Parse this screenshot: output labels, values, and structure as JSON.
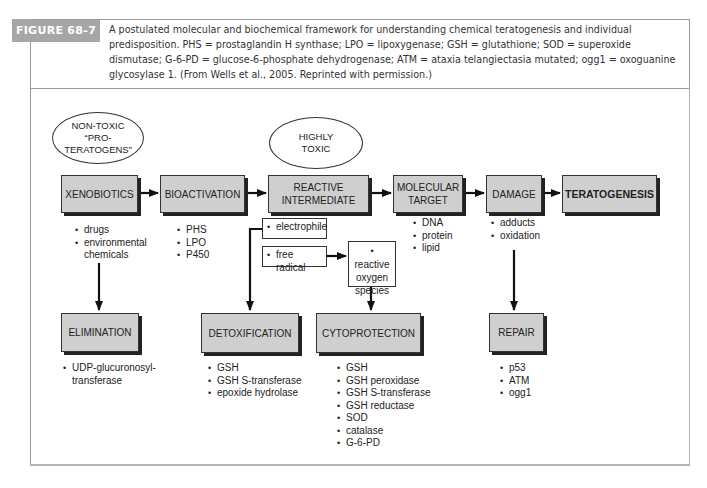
{
  "figure": {
    "label": "FIGURE 68-7",
    "caption": "A postulated molecular and biochemical framework for understanding chemical teratogenesis and individual predisposition. PHS = prostaglandin H synthase; LPO = lipoxygenase; GSH = glutathione; SOD = superoxide dismutase; G-6-PD = glucose-6-phosphate dehydrogenase; ATM = ataxia telangiectasia mutated; ogg1 = oxoguanine glycosylase 1. (From Wells et al., 2005. Reprinted with permission.)",
    "accent_color": "#a6a6a6"
  },
  "ellipses": {
    "non_toxic": [
      "NON-TOXIC",
      "“PRO-",
      "TERATOGENS”"
    ],
    "highly_toxic": [
      "HIGHLY",
      "TOXIC"
    ]
  },
  "main_flow": {
    "xenobiotics": "XENOBIOTICS",
    "bioactivation": "BIOACTIVATION",
    "reactive_intermediate": [
      "REACTIVE",
      "INTERMEDIATE"
    ],
    "molecular_target": [
      "MOLECULAR",
      "TARGET"
    ],
    "damage": "DAMAGE",
    "teratogenesis": "TERATOGENESIS"
  },
  "sub_lists": {
    "xenobiotics": [
      "drugs",
      "environmental",
      "chemicals"
    ],
    "bioactivation": [
      "PHS",
      "LPO",
      "P450"
    ],
    "molecular_target": [
      "DNA",
      "protein",
      "lipid"
    ],
    "damage": [
      "adducts",
      "oxidation"
    ]
  },
  "intermediates": {
    "electrophile": "electrophile",
    "free_radical": "free radical",
    "ros": [
      "reactive",
      "oxygen",
      "species"
    ]
  },
  "defense": {
    "elimination": {
      "label": "ELIMINATION",
      "items": [
        "UDP-glucuronosyl-",
        "transferase"
      ]
    },
    "detoxification": {
      "label": "DETOXIFICATION",
      "items": [
        "GSH",
        "GSH S-transferase",
        "epoxide hydrolase"
      ]
    },
    "cytoprotection": {
      "label": "CYTOPROTECTION",
      "items": [
        "GSH",
        "GSH peroxidase",
        "GSH S-transferase",
        "GSH reductase",
        "SOD",
        "catalase",
        "G-6-PD"
      ]
    },
    "repair": {
      "label": "REPAIR",
      "items": [
        "p53",
        "ATM",
        "ogg1"
      ]
    }
  }
}
